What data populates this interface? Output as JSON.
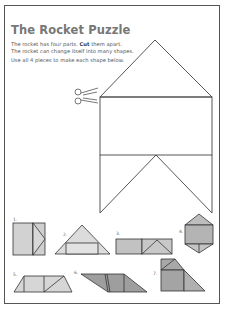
{
  "page": {
    "title": "The Rocket Puzzle",
    "instructions": {
      "line1_pre": "The rocket has four parts. ",
      "line1_bold": "Cut",
      "line1_post": " them apart.",
      "line2": "The rocket can change itself into many shapes.",
      "line3": "Use all 4 pieces to make each shape below."
    },
    "icons": {
      "scissors": "scissors-icon"
    },
    "shapes": [
      {
        "number": "1."
      },
      {
        "number": "2."
      },
      {
        "number": "3."
      },
      {
        "number": "4."
      },
      {
        "number": "5."
      },
      {
        "number": "6."
      },
      {
        "number": "7."
      }
    ],
    "colors": {
      "light_fill": "#d4d4d4",
      "dark_fill": "#9a9a9a",
      "mid_fill": "#b8b8b8",
      "stroke": "#333333",
      "border": "#555555"
    }
  }
}
